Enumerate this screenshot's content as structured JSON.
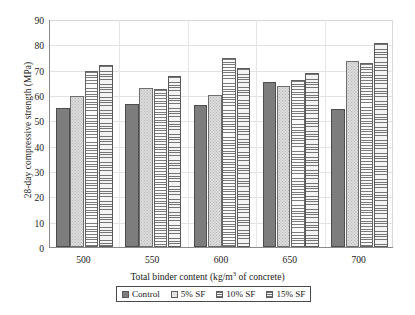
{
  "chart_data": {
    "type": "bar",
    "title": "",
    "xlabel_parts": {
      "before": "Total binder content (kg/m",
      "sup": "3",
      "after": " of concrete)"
    },
    "xlabel": "Total binder content (kg/m3 of concrete)",
    "ylabel": "28-day compressive strength (MPa)",
    "categories": [
      "500",
      "550",
      "600",
      "650",
      "700"
    ],
    "series": [
      {
        "name": "Control",
        "pattern": "solid-gray",
        "color": "#7d7d7d",
        "values": [
          55.0,
          56.3,
          56.0,
          65.2,
          54.3
        ]
      },
      {
        "name": "5% SF",
        "pattern": "light-dotted",
        "color": "#dcdcdc",
        "values": [
          59.5,
          62.7,
          60.0,
          63.4,
          73.6
        ]
      },
      {
        "name": "10% SF",
        "pattern": "horizontal-lines",
        "color": "#f2f2f2",
        "values": [
          69.3,
          62.5,
          74.8,
          66.0,
          72.5
        ]
      },
      {
        "name": "15% SF",
        "pattern": "crosshatch",
        "color": "#ededed",
        "values": [
          72.0,
          67.5,
          70.7,
          68.7,
          80.5
        ]
      }
    ],
    "ylim": [
      0,
      90
    ],
    "yticks": [
      0,
      10,
      20,
      30,
      40,
      50,
      60,
      70,
      80,
      90
    ],
    "ytick_labels": [
      "0",
      "10",
      "20",
      "30",
      "40",
      "50",
      "60",
      "70",
      "80",
      "90"
    ],
    "grid": true,
    "grid_axis": "both",
    "legend_position": "bottom",
    "legend_entries": [
      "Control",
      "5% SF",
      "10% SF",
      "15% SF"
    ]
  }
}
